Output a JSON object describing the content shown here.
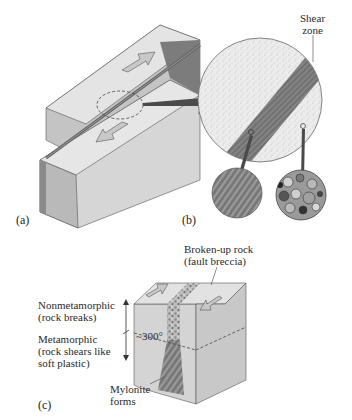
{
  "figure": {
    "panels": [
      {
        "id": "a",
        "label": "(a)",
        "description": "Block diagram of a strike-slip fault with opposing motion arrows and dashed ellipse highlighting the shear zone"
      },
      {
        "id": "b",
        "label": "(b)",
        "description": "Magnified circular view of the shear zone with two further magnified textures",
        "callouts": {
          "shear_zone": "Shear\nzone",
          "shear_zone_line1": "Shear",
          "shear_zone_line2": "zone"
        },
        "insets": [
          {
            "name": "mylonite-texture",
            "description": "Fine streaked, foliated texture from within the shear zone"
          },
          {
            "name": "undeformed-rock-texture",
            "description": "Coarse granular crystal texture from host rock"
          }
        ]
      },
      {
        "id": "c",
        "label": "(c)",
        "description": "Block showing fault at depth: brittle breccia near surface, mylonite below 300°",
        "labels": {
          "top_right_line1": "Broken-up rock",
          "top_right_line2": "(fault breccia)",
          "upper_left_line1": "Nonmetamorphic",
          "upper_left_line2": "(rock breaks)",
          "lower_left_line1": "Metamorphic",
          "lower_left_line2": "(rock shears like",
          "lower_left_line3": "soft plastic)",
          "temperature": "~300°",
          "bottom_line1": "Mylonite",
          "bottom_line2": "forms"
        }
      }
    ]
  },
  "colors": {
    "block_top": "#e2e2e2",
    "block_front": "#d2d2d2",
    "block_side": "#a8a8a8",
    "shear_band": "#7a7a7a",
    "arrow_fill": "#c8c8c8",
    "pointer": "#4a4a4a"
  }
}
